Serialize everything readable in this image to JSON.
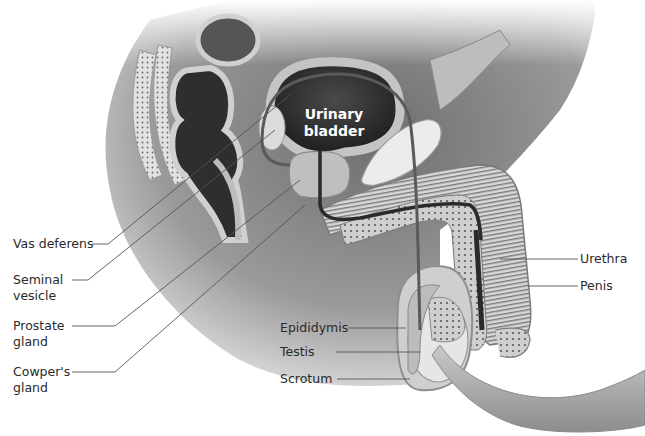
{
  "diagram": {
    "palette": {
      "background": "#ffffff",
      "body_shade": "#8a8a8a",
      "tissue_light": "#d6d6d6",
      "tissue_dark": "#3a3a3a",
      "label_text": "#2a2a2a",
      "leader_line": "#555555",
      "inner_label_text": "#ffffff"
    },
    "inner_labels": {
      "bladder_line1": "Urinary",
      "bladder_line2": "bladder"
    },
    "labels_left": [
      {
        "id": "vas-deferens",
        "line1": "Vas deferens",
        "line2": ""
      },
      {
        "id": "seminal-vesicle",
        "line1": "Seminal",
        "line2": "vesicle"
      },
      {
        "id": "prostate-gland",
        "line1": "Prostate",
        "line2": "gland"
      },
      {
        "id": "cowpers-gland",
        "line1": "Cowper's",
        "line2": "gland"
      }
    ],
    "labels_center": [
      {
        "id": "epididymis",
        "text": "Epididymis"
      },
      {
        "id": "testis",
        "text": "Testis"
      },
      {
        "id": "scrotum",
        "text": "Scrotum"
      }
    ],
    "labels_right": [
      {
        "id": "urethra",
        "text": "Urethra"
      },
      {
        "id": "penis",
        "text": "Penis"
      }
    ]
  }
}
